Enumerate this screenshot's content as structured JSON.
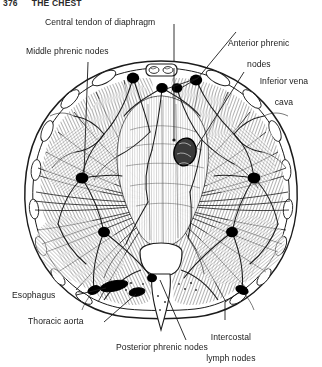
{
  "page": {
    "folio": "376",
    "running_head": "THE CHEST",
    "background_color": "#ffffff",
    "ink_color": "#1b1b1b"
  },
  "figure": {
    "name": "transverse-section-of-diaphragm-lymphatics",
    "node_color": "#000000"
  },
  "labels": [
    {
      "id": "central-tendon",
      "text": "Central tendon of diaphragm",
      "align": "left"
    },
    {
      "id": "anterior-phrenic",
      "line1": "Anterior phrenic",
      "line2": "nodes",
      "align": "center"
    },
    {
      "id": "middle-phrenic",
      "text": "Middle phrenic nodes",
      "align": "left"
    },
    {
      "id": "inferior-vena-cava",
      "line1": "Inferior vena",
      "line2": "cava",
      "align": "center"
    },
    {
      "id": "esophagus",
      "text": "Esophagus",
      "align": "left"
    },
    {
      "id": "thoracic-aorta",
      "text": "Thoracic aorta",
      "align": "left"
    },
    {
      "id": "intercostal",
      "line1": "Intercostal",
      "line2": "lymph nodes",
      "align": "center"
    },
    {
      "id": "posterior-phrenic",
      "text": "Posterior phrenic nodes",
      "align": "center"
    }
  ]
}
